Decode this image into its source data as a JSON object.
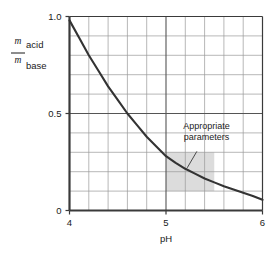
{
  "chart_data": {
    "type": "line",
    "title": "",
    "xlabel": "pH",
    "ylabel_numerator_symbol": "m",
    "ylabel_numerator_sub": "acid",
    "ylabel_denominator_symbol": "m",
    "ylabel_denominator_sub": "base",
    "xlim": [
      4,
      6
    ],
    "ylim": [
      0,
      1.0
    ],
    "x_ticks_major": [
      4,
      5,
      6
    ],
    "x_tick_labels_major": [
      "4",
      "5",
      "6"
    ],
    "x_ticks_minor": [
      4.2,
      4.4,
      4.6,
      4.8,
      5.2,
      5.4,
      5.6,
      5.8
    ],
    "y_ticks_major": [
      0,
      0.5,
      1.0
    ],
    "y_tick_labels_major": [
      "0",
      "0.5",
      "1.0"
    ],
    "y_ticks_minor": [
      0.1,
      0.2,
      0.3,
      0.4,
      0.6,
      0.7,
      0.8,
      0.9
    ],
    "grid": true,
    "legend": "none",
    "series": [
      {
        "name": "acid/base mass ratio",
        "x": [
          4.0,
          4.1,
          4.2,
          4.3,
          4.4,
          4.5,
          4.6,
          4.7,
          4.8,
          4.9,
          5.0,
          5.1,
          5.2,
          5.3,
          5.4,
          5.5,
          5.6,
          5.7,
          5.8,
          5.9,
          6.0
        ],
        "y": [
          0.98,
          0.89,
          0.8,
          0.72,
          0.64,
          0.57,
          0.5,
          0.44,
          0.38,
          0.33,
          0.28,
          0.245,
          0.215,
          0.19,
          0.165,
          0.145,
          0.125,
          0.108,
          0.092,
          0.075,
          0.055
        ]
      }
    ],
    "shaded_region": {
      "label": "Appropriate parameters",
      "x_range": [
        5.0,
        5.5
      ],
      "y_range": [
        0.1,
        0.3
      ],
      "color": "#dcdcdc"
    },
    "annotations": [
      {
        "text_line_1": "Appropriate",
        "text_line_2": "parameters",
        "leader_from_x": 5.32,
        "leader_from_y": 0.305,
        "leader_to_x": 5.22,
        "leader_to_y": 0.22
      }
    ],
    "curve_color": "#333333",
    "axis_color": "#3a3a3a",
    "grid_color": "#8a8a8a"
  }
}
